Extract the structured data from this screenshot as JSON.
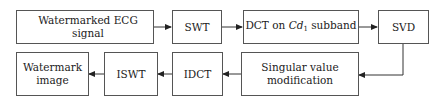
{
  "diagram": {
    "nodes": {
      "ecg_signal": "Watermarked ECG signal",
      "swt": "SWT",
      "dct_prefix": "DCT on ",
      "dct_var": "Cd",
      "dct_sub": "1",
      "dct_suffix": " subband",
      "svd": "SVD",
      "sv_mod_line1": "Singular value",
      "sv_mod_line2": "modification",
      "idct": "IDCT",
      "iswt": "ISWT",
      "wm_line1": "Watermark",
      "wm_line2": "image"
    },
    "edges": [
      {
        "from": "Watermarked ECG signal",
        "to": "SWT"
      },
      {
        "from": "SWT",
        "to": "DCT on Cd1 subband"
      },
      {
        "from": "DCT on Cd1 subband",
        "to": "SVD"
      },
      {
        "from": "SVD",
        "to": "Singular value modification"
      },
      {
        "from": "Singular value modification",
        "to": "IDCT"
      },
      {
        "from": "IDCT",
        "to": "ISWT"
      },
      {
        "from": "ISWT",
        "to": "Watermark image"
      }
    ]
  }
}
